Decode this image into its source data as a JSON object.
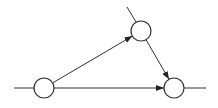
{
  "diagram": {
    "type": "directed-graph",
    "stroke_color": "#333333",
    "node_fill": "#ffffff",
    "nodes": [
      {
        "id": "A",
        "cx": 44,
        "cy": 88,
        "r": 10
      },
      {
        "id": "B",
        "cx": 141,
        "cy": 31,
        "r": 10
      },
      {
        "id": "C",
        "cx": 174,
        "cy": 88,
        "r": 10
      }
    ],
    "edges": [
      {
        "from": "A",
        "to": "B",
        "directed": true
      },
      {
        "from": "B",
        "to": "C",
        "directed": true
      },
      {
        "from": "A",
        "to": "C",
        "directed": true
      }
    ],
    "stubs": [
      {
        "attached_to": "A",
        "x1": 14,
        "y1": 88,
        "x2": 34,
        "y2": 88
      },
      {
        "attached_to": "B",
        "x1": 127,
        "y1": 7,
        "x2": 136,
        "y2": 22
      },
      {
        "attached_to": "C",
        "x1": 184,
        "y1": 88,
        "x2": 206,
        "y2": 88
      }
    ]
  }
}
